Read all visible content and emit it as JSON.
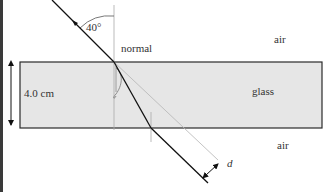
{
  "diagram": {
    "type": "refraction through glass slab",
    "labels": {
      "angle": "40°",
      "normal": "normal",
      "air_top": "air",
      "glass": "glass",
      "air_bottom": "air",
      "thickness": "4.0 cm",
      "displacement": "d"
    },
    "colors": {
      "glass_fill": "#e6e6e6",
      "glass_border": "#2a2a2a",
      "ray": "#111111",
      "normal_line": "#aaaaaa",
      "extension_line": "#b5b5b5",
      "left_bar": "#3a3a3a"
    },
    "geometry": {
      "glass_block": {
        "x": 20,
        "y": 62,
        "width": 302,
        "height": 66
      },
      "incident_ray": {
        "x1": 52,
        "y1": 0,
        "x2": 114,
        "y2": 62
      },
      "refracted_ray": {
        "x1": 114,
        "y1": 62,
        "x2": 151,
        "y2": 128
      },
      "emergent_ray": {
        "x1": 151,
        "y1": 128,
        "x2": 208,
        "y2": 183
      },
      "extension_line": {
        "x1": 114,
        "y1": 62,
        "x2": 218,
        "y2": 160
      }
    }
  }
}
